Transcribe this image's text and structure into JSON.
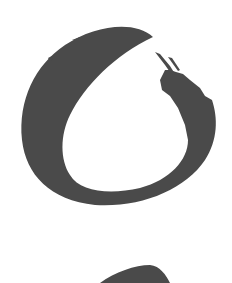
{
  "image": {
    "subject": "enso-brushstroke-circle",
    "colors": {
      "ink": "#4a4a4a",
      "background": "#ffffff"
    }
  }
}
